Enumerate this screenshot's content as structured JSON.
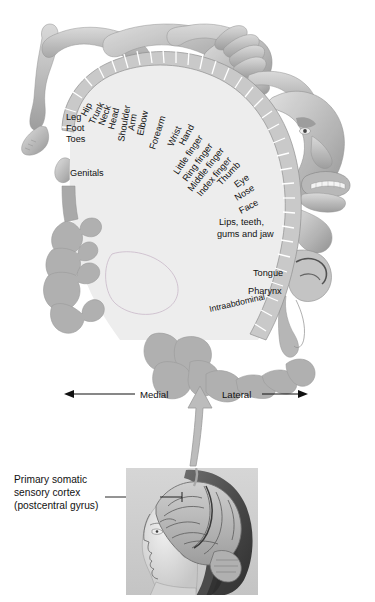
{
  "figure": {
    "type": "anatomical-diagram",
    "colors": {
      "cortex_band": "#c9c9c9",
      "cortex_interior": "#ececec",
      "gyrus_fold": "#aeaeae",
      "body_figure": "#b9b9b9",
      "outline": "#8c8c8c",
      "text": "#111111",
      "arrow": "#b4b4b4",
      "background": "#ffffff"
    }
  },
  "cortex_labels": {
    "medial_group": [
      {
        "id": "hip",
        "text": "Hip"
      },
      {
        "id": "leg",
        "text": "Leg"
      },
      {
        "id": "foot",
        "text": "Foot"
      },
      {
        "id": "toes",
        "text": "Toes"
      },
      {
        "id": "genitals",
        "text": "Genitals"
      }
    ],
    "arc_group": [
      {
        "id": "trunk",
        "text": "Trunk"
      },
      {
        "id": "neck",
        "text": "Neck"
      },
      {
        "id": "head",
        "text": "Head"
      },
      {
        "id": "shoulder",
        "text": "Shoulder"
      },
      {
        "id": "arm",
        "text": "Arm"
      },
      {
        "id": "elbow",
        "text": "Elbow"
      },
      {
        "id": "forearm",
        "text": "Forearm"
      },
      {
        "id": "wrist",
        "text": "Wrist"
      },
      {
        "id": "hand",
        "text": "Hand"
      },
      {
        "id": "little-finger",
        "text": "Little finger"
      },
      {
        "id": "ring-finger",
        "text": "Ring finger"
      },
      {
        "id": "middle-finger",
        "text": "Middle finger"
      },
      {
        "id": "index-finger",
        "text": "Index finger"
      },
      {
        "id": "thumb",
        "text": "Thumb"
      },
      {
        "id": "eye",
        "text": "Eye"
      },
      {
        "id": "nose",
        "text": "Nose"
      },
      {
        "id": "face",
        "text": "Face"
      }
    ],
    "lateral_group": [
      {
        "id": "lips",
        "text": "Lips, teeth,"
      },
      {
        "id": "lips2",
        "text": "gums and jaw"
      },
      {
        "id": "tongue",
        "text": "Tongue"
      },
      {
        "id": "pharynx",
        "text": "Pharynx"
      },
      {
        "id": "intraabdominal",
        "text": "Intraabdominal"
      }
    ]
  },
  "axis": {
    "medial_label": "Medial",
    "lateral_label": "Lateral"
  },
  "caption": {
    "line1": "Primary somatic",
    "line2": "sensory cortex",
    "line3": "(postcentral gyrus)"
  },
  "inset": {
    "name": "head-profile-brain-photo",
    "description": "Lateral view photograph of a human head with exposed cerebral hemisphere"
  }
}
